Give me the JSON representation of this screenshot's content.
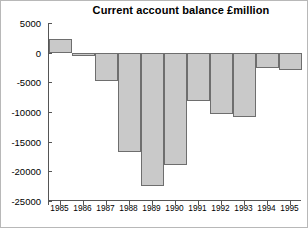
{
  "chart_data": {
    "type": "bar",
    "title": "Current account balance £million",
    "xlabel": "",
    "ylabel": "",
    "categories": [
      "1985",
      "1986",
      "1987",
      "1988",
      "1989",
      "1990",
      "1991",
      "1992",
      "1993",
      "1994",
      "1995"
    ],
    "values": [
      2350,
      -550,
      -4750,
      -16700,
      -22400,
      -18900,
      -8100,
      -10300,
      -10800,
      -2550,
      -3000
    ],
    "ylim": [
      -25000,
      5000
    ],
    "ytick_labels": [
      "5000",
      "0",
      "-5000",
      "-10000",
      "-15000",
      "-20000",
      "-25000"
    ],
    "ytick_values": [
      5000,
      0,
      -5000,
      -10000,
      -15000,
      -20000,
      -25000
    ],
    "grid": false,
    "legend": null,
    "bar_fill_color": "#c9c9c9",
    "bar_border_color": "#6e6e6e",
    "axis_color": "#555555",
    "background_color": "#ffffff"
  }
}
